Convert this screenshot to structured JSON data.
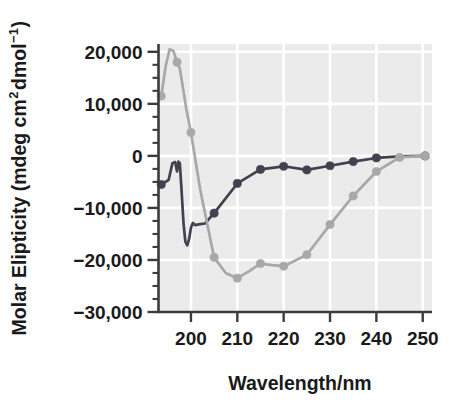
{
  "chart_data": {
    "type": "line",
    "title": "",
    "xlabel": "Wavelength/nm",
    "ylabel": "Molar Elipticity (mdeg cm",
    "ylabel_sup": "2",
    "ylabel_mid": " dmol ",
    "ylabel_sup2": "−1",
    "ylabel_end": ")",
    "ylabel_full": "Molar Elipticity (mdeg cm2 dmol −1)",
    "xlim": [
      193,
      252
    ],
    "ylim": [
      -30000,
      21500
    ],
    "xticks": [
      200,
      210,
      220,
      230,
      240,
      250
    ],
    "xtick_labels": [
      "200",
      "210",
      "220",
      "230",
      "240",
      "250"
    ],
    "yticks": [
      20000,
      10000,
      0,
      -10000,
      -20000,
      -30000
    ],
    "ytick_labels": [
      "20,000",
      "10,000",
      "0",
      "−10,000",
      "−20,000",
      "−30,000"
    ],
    "y_minor_step": 2500,
    "grid": true,
    "grid_color": "#ffffff",
    "plot_background": "#ebebeb",
    "legend": "none",
    "series": [
      {
        "name": "dark-trace",
        "color": "#41414f",
        "marker": "circle",
        "marker_color": "#41414f",
        "x": [
          193.6,
          195.2,
          196.0,
          196.6,
          197.0,
          197.3,
          197.6,
          198.0,
          198.4,
          198.8,
          199.2,
          199.6,
          200.0,
          200.4,
          200.9,
          201.4,
          202.0,
          203.0,
          205.0,
          210.0,
          215.0,
          220.0,
          225.0,
          230.0,
          235.0,
          240.0,
          245.0,
          250.5
        ],
        "y": [
          -5500,
          -4600,
          -1400,
          -1200,
          -3000,
          -1100,
          -1400,
          -7000,
          -13000,
          -16500,
          -17200,
          -16000,
          -13800,
          -12900,
          -13300,
          -13200,
          -13100,
          -13000,
          -11000,
          -5300,
          -2600,
          -2000,
          -2700,
          -1900,
          -1100,
          -400,
          -100,
          0
        ],
        "markers_x": [
          193.6,
          205.0,
          210.0,
          215.0,
          220.0,
          225.0,
          230.0,
          235.0,
          240.0,
          250.5
        ],
        "markers_y": [
          -5500,
          -11000,
          -5300,
          -2600,
          -2000,
          -2700,
          -1900,
          -1100,
          -400,
          0
        ]
      },
      {
        "name": "light-trace",
        "color": "#a8a8a8",
        "marker": "circle",
        "marker_color": "#a8a8a8",
        "x": [
          193.6,
          194.6,
          195.4,
          196.2,
          197.0,
          197.6,
          198.2,
          199.0,
          200.0,
          202.0,
          205.0,
          207.5,
          210.0,
          212.5,
          215.0,
          217.5,
          220.0,
          222.5,
          225.0,
          230.0,
          235.0,
          240.0,
          245.0,
          250.5
        ],
        "y": [
          11500,
          17500,
          20500,
          20200,
          18000,
          16800,
          13500,
          9000,
          4500,
          -6500,
          -19500,
          -22500,
          -23500,
          -22200,
          -20700,
          -21000,
          -21200,
          -20100,
          -19000,
          -13200,
          -7700,
          -3000,
          -300,
          0
        ],
        "markers_x": [
          193.6,
          197.0,
          200.0,
          205.0,
          210.0,
          215.0,
          220.0,
          225.0,
          230.0,
          235.0,
          240.0,
          245.0,
          250.5
        ],
        "markers_y": [
          11500,
          18000,
          4500,
          -19500,
          -23500,
          -20700,
          -21200,
          -19000,
          -13200,
          -7700,
          -3000,
          -300,
          0
        ]
      }
    ]
  }
}
